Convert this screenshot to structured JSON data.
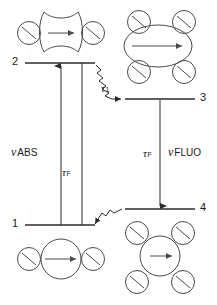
{
  "diagram": {
    "levels": [
      {
        "id": "level-2",
        "number": "2",
        "label_x": 14,
        "label_y": 57,
        "line_x1": 25,
        "line_x2": 95,
        "line_y": 63
      },
      {
        "id": "level-3",
        "number": "3",
        "label_x": 200,
        "label_y": 93,
        "line_x1": 125,
        "line_x2": 195,
        "line_y": 99
      },
      {
        "id": "level-1",
        "number": "1",
        "label_x": 14,
        "label_y": 219,
        "line_x1": 25,
        "line_x2": 95,
        "line_y": 225
      },
      {
        "id": "level-4",
        "number": "4",
        "label_x": 200,
        "label_y": 203,
        "line_x1": 125,
        "line_x2": 195,
        "line_y": 209
      }
    ],
    "labels": {
      "nu_abs": {
        "symbol": "ν",
        "text": "ABS",
        "x": 11,
        "y": 146
      },
      "nu_fluo": {
        "symbol": "ν",
        "text": "FLUO",
        "x": 170,
        "y": 146
      },
      "tau_f_left": {
        "symbol": "τ",
        "sub": "F",
        "x": 62,
        "y": 167
      },
      "tau_f_right": {
        "symbol": "τ",
        "sub": "F",
        "x": 143,
        "y": 148
      },
      "tau_1": {
        "symbol": "τ",
        "sub": "1",
        "x": 102,
        "y": 83
      }
    },
    "transitions": [
      {
        "name": "absorption-arrow",
        "kind": "straight-arrow-up",
        "x": 61,
        "from_y": 225,
        "to_y": 64
      },
      {
        "name": "absorption-return-line",
        "kind": "plain-vertical-line",
        "x": 82,
        "from_y": 225,
        "to_y": 63
      },
      {
        "name": "fluorescence-arrow",
        "kind": "straight-arrow-down",
        "x": 160,
        "from_y": 100,
        "to_y": 208
      },
      {
        "name": "nonradiative-relaxation-upper",
        "kind": "zigzag-arrow",
        "x1": 96,
        "y1": 65,
        "x2": 128,
        "y2": 99
      },
      {
        "name": "nonradiative-relaxation-lower",
        "kind": "zigzag-arrow",
        "x1": 96,
        "y1": 224,
        "x2": 126,
        "y2": 209
      }
    ],
    "states": {
      "upper_left": {
        "name": "excited-distorted-state",
        "shape": "pinched-hourglass",
        "cx": 61,
        "cy": 32,
        "arrow": "horizontal-right",
        "satellites": 2
      },
      "upper_right": {
        "name": "excited-relaxed-state",
        "shape": "ellipse",
        "cx": 158,
        "cy": 43,
        "arrow": "horizontal-right",
        "satellites": 4
      },
      "lower_left": {
        "name": "ground-state-compact",
        "shape": "circle",
        "cx": 61,
        "cy": 258,
        "arrow": "horizontal-right",
        "satellites": 2
      },
      "lower_right": {
        "name": "ground-state-solvated",
        "shape": "circle",
        "cx": 160,
        "cy": 260,
        "arrow": "horizontal-right",
        "satellites": 4
      }
    },
    "colors": {
      "stroke": "#2b2b2b",
      "solvent_stroke": "#4a4a4a",
      "background": "#ffffff"
    }
  }
}
